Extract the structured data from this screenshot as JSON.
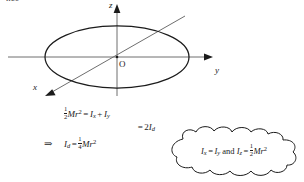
{
  "figure": {
    "top_fragment": "nce",
    "diagram": {
      "shape_name": "disc-ellipse",
      "axes": [
        {
          "id": "z",
          "label": "z",
          "direction": "up"
        },
        {
          "id": "y",
          "label": "y",
          "direction": "right"
        },
        {
          "id": "x",
          "label": "x",
          "direction": "down-left"
        }
      ],
      "origin_label": "O",
      "line_color": "#1b1b1b",
      "axis_color": "#6e6e6e"
    },
    "derivation": {
      "lines": [
        {
          "lead": "",
          "parts": [
            {
              "type": "frac",
              "num": "1",
              "den": "2"
            },
            {
              "type": "mi",
              "text": "M"
            },
            {
              "type": "mi",
              "text": "r"
            },
            {
              "type": "sup",
              "text": "2"
            },
            {
              "type": "op",
              "text": "="
            },
            {
              "type": "mi",
              "text": "I"
            },
            {
              "type": "sub",
              "text": "x"
            },
            {
              "type": "op",
              "text": "+"
            },
            {
              "type": "mi",
              "text": "I"
            },
            {
              "type": "sub",
              "text": "y"
            }
          ],
          "align": "left"
        },
        {
          "lead": "",
          "parts": [
            {
              "type": "op",
              "text": "="
            },
            {
              "type": "mn",
              "text": "2"
            },
            {
              "type": "mi",
              "text": "I"
            },
            {
              "type": "sub",
              "text": "d"
            }
          ],
          "align": "right"
        },
        {
          "lead": "⇒",
          "parts": [
            {
              "type": "mi",
              "text": "I"
            },
            {
              "type": "sub",
              "text": "d"
            },
            {
              "type": "op",
              "text": "="
            },
            {
              "type": "frac",
              "num": "1",
              "den": "4"
            },
            {
              "type": "mi",
              "text": "M"
            },
            {
              "type": "mi",
              "text": "r"
            },
            {
              "type": "sup",
              "text": "2"
            }
          ],
          "align": "left"
        }
      ]
    },
    "cloud": {
      "shape_name": "thought-cloud",
      "parts": [
        {
          "type": "mi",
          "text": "I"
        },
        {
          "type": "sub",
          "text": "x"
        },
        {
          "type": "op",
          "text": "="
        },
        {
          "type": "mi",
          "text": "I"
        },
        {
          "type": "sub",
          "text": "y"
        },
        {
          "type": "text",
          "text": " and "
        },
        {
          "type": "mi",
          "text": "I"
        },
        {
          "type": "sub",
          "text": "z"
        },
        {
          "type": "op",
          "text": "="
        },
        {
          "type": "frac",
          "num": "1",
          "den": "2"
        },
        {
          "type": "mi",
          "text": "M"
        },
        {
          "type": "mi",
          "text": "r"
        },
        {
          "type": "sup",
          "text": "2"
        }
      ]
    }
  }
}
